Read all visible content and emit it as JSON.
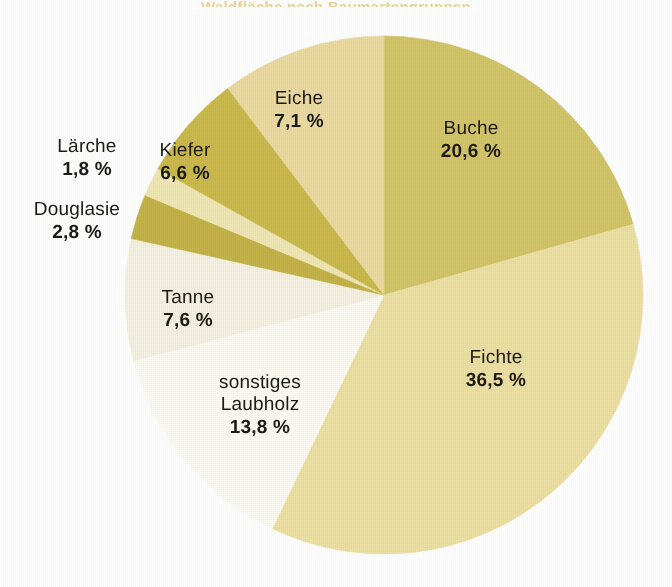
{
  "chart_data": {
    "type": "pie",
    "title": "Waldfläche nach Baumartengruppen",
    "xlabel": "",
    "ylabel": "",
    "unit": "%",
    "legend_position": "none",
    "grid": false,
    "labels_on_slices": true,
    "start_angle_deg": 0,
    "direction": "clockwise",
    "categories": [
      "Buche",
      "Fichte",
      "sonstiges Laubholz",
      "Tanne",
      "Douglasie",
      "Lärche",
      "Kiefer",
      "Eiche"
    ],
    "values": [
      20.6,
      36.5,
      13.8,
      7.6,
      2.8,
      1.8,
      6.6,
      7.1
    ],
    "value_labels": [
      "20,6 %",
      "36,5 %",
      "13,8 %",
      "7,6 %",
      "2,8 %",
      "1,8 %",
      "6,6 %",
      "7,1 %"
    ],
    "colors": [
      "#d2c46b",
      "#ecdfa4",
      "#fbfaf3",
      "#f4f1e2",
      "#c3b24a",
      "#eee6b4",
      "#c9b94e",
      "#ead9a0"
    ],
    "total": 96.8
  },
  "slices": [
    {
      "name": "Buche",
      "value": 20.6,
      "value_label": "20,6 %",
      "color": "#d2c46b",
      "start_angle": 0,
      "sweep_angle": 74.16
    },
    {
      "name": "Fichte",
      "value": 36.5,
      "value_label": "36,5 %",
      "color": "#ecdfa4",
      "start_angle": 74.16,
      "sweep_angle": 131.4
    },
    {
      "name": "sonstiges",
      "name2": "Laubholz",
      "value": 13.8,
      "value_label": "13,8 %",
      "color": "#fbfaf3",
      "start_angle": 205.56,
      "sweep_angle": 49.68
    },
    {
      "name": "Tanne",
      "value": 7.6,
      "value_label": "7,6 %",
      "color": "#f4f1e2",
      "start_angle": 255.24,
      "sweep_angle": 27.36
    },
    {
      "name": "Douglasie",
      "value": 2.8,
      "value_label": "2,8 %",
      "color": "#c3b24a",
      "start_angle": 282.6,
      "sweep_angle": 10.08
    },
    {
      "name": "Lärche",
      "value": 1.8,
      "value_label": "1,8 %",
      "color": "#eee6b4",
      "start_angle": 292.68,
      "sweep_angle": 6.48
    },
    {
      "name": "Kiefer",
      "value": 6.6,
      "value_label": "6,6 %",
      "color": "#c9b94e",
      "start_angle": 299.16,
      "sweep_angle": 23.76
    },
    {
      "name": "Eiche",
      "value": 7.1,
      "value_label": "7,1 %",
      "color": "#ead9a0",
      "start_angle": 322.92,
      "sweep_angle": 37.08
    }
  ],
  "geometry": {
    "center_x": 384,
    "center_y": 295,
    "radius": 259
  },
  "palette": {
    "background": "#ffffff",
    "text": "#1b1a16",
    "title": "#d9b442"
  }
}
